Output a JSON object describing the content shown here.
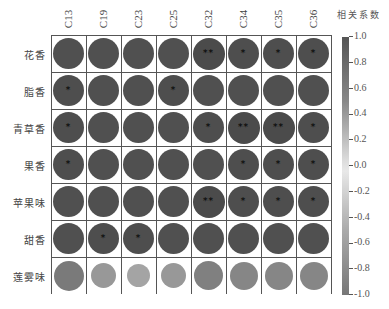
{
  "chart_data": {
    "type": "heatmap",
    "subtype": "correlation-circle-matrix",
    "columns": [
      "C13",
      "C19",
      "C23",
      "C25",
      "C32",
      "C34",
      "C35",
      "C36"
    ],
    "rows": [
      "花香",
      "脂香",
      "青草香",
      "果香",
      "苹果味",
      "甜香",
      "莲雾味"
    ],
    "values": [
      [
        0.95,
        0.95,
        0.95,
        0.95,
        0.98,
        0.96,
        0.96,
        0.96
      ],
      [
        0.96,
        0.95,
        0.95,
        0.96,
        0.95,
        0.95,
        0.95,
        0.95
      ],
      [
        0.96,
        0.95,
        0.95,
        0.95,
        0.96,
        0.98,
        0.98,
        0.96
      ],
      [
        0.96,
        0.95,
        0.95,
        0.95,
        0.95,
        0.96,
        0.96,
        0.96
      ],
      [
        0.95,
        0.95,
        0.95,
        0.95,
        0.98,
        0.96,
        0.96,
        0.96
      ],
      [
        0.95,
        0.96,
        0.96,
        0.95,
        0.95,
        0.95,
        0.95,
        0.95
      ],
      [
        -0.9,
        -0.65,
        -0.55,
        -0.65,
        -0.85,
        -0.8,
        -0.8,
        -0.8
      ]
    ],
    "significance": [
      [
        "",
        "",
        "",
        "",
        "**",
        "*",
        "*",
        "*"
      ],
      [
        "*",
        "",
        "",
        "*",
        "",
        "",
        "",
        ""
      ],
      [
        "*",
        "",
        "",
        "",
        "*",
        "**",
        "**",
        "*"
      ],
      [
        "*",
        "",
        "",
        "",
        "",
        "*",
        "*",
        "*"
      ],
      [
        "",
        "",
        "",
        "",
        "**",
        "*",
        "*",
        "*"
      ],
      [
        "",
        "*",
        "*",
        "",
        "",
        "",
        "",
        ""
      ],
      [
        "",
        "",
        "",
        "",
        "",
        "",
        "",
        ""
      ]
    ],
    "colorbar": {
      "title": "相关系数",
      "ticks": [
        "1.0",
        "0.8",
        "0.6",
        "0.4",
        "0.2",
        "0.0",
        "-0.2",
        "-0.4",
        "-0.6",
        "-0.8",
        "-1.0"
      ],
      "range": [
        -1.0,
        1.0
      ]
    },
    "title": "",
    "xlabel": "",
    "ylabel": ""
  },
  "colors": {
    "strong_positive": "#4a4a4a",
    "negative": "#7a7a7a",
    "grid": "#555555"
  }
}
